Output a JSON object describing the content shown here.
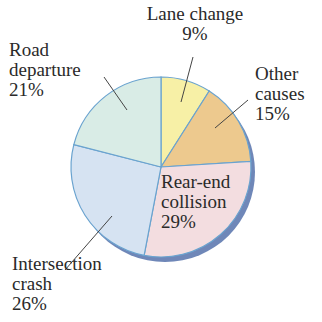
{
  "chart_data": {
    "type": "pie",
    "title": "",
    "categories": [
      "Lane change",
      "Other causes",
      "Rear-end collision",
      "Intersection crash",
      "Road departure"
    ],
    "values": [
      9,
      15,
      29,
      26,
      21
    ],
    "unit": "%",
    "colors": [
      "#f7f0a6",
      "#edc98e",
      "#f3dde0",
      "#d6e3f2",
      "#d9ece6"
    ],
    "start_angle_deg": 0,
    "direction": "clockwise",
    "legend": "none",
    "labels_outside": true
  },
  "labels": {
    "lane_change": {
      "line1": "Lane change",
      "line2": "9%"
    },
    "other": {
      "line1": "Other",
      "line2": "causes",
      "line3": "15%"
    },
    "rear_end": {
      "line1": "Rear-end",
      "line2": "collision",
      "line3": "29%"
    },
    "intersection": {
      "line1": "Intersection",
      "line2": "crash",
      "line3": "26%"
    },
    "road": {
      "line1": "Road",
      "line2": "departure",
      "line3": "21%"
    }
  },
  "style": {
    "edge_color": "#6aa3cf",
    "shadow_color": "#6f87b8"
  }
}
